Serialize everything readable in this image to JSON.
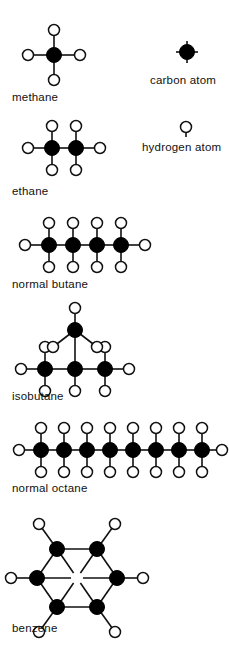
{
  "figure": {
    "background_color": "#ffffff",
    "bond_color": "#111111",
    "carbon_color": "#000000",
    "hydrogen_fill": "#ffffff",
    "hydrogen_stroke": "#111111",
    "carbon_radius": 7.5,
    "hydrogen_radius": 5.5,
    "width": 229,
    "height": 649
  },
  "legend": {
    "carbon": {
      "label": "carbon atom",
      "label_x": 150,
      "label_y": 84,
      "center_x": 187,
      "center_y": 52,
      "stub_length": 11
    },
    "hydrogen": {
      "label": "hydrogen atom",
      "label_x": 142,
      "label_y": 151,
      "center_x": 186,
      "center_y": 127,
      "stub_length": 10
    }
  },
  "molecules": [
    {
      "name": "methane",
      "formula_carbons": 1,
      "label_x": 12,
      "label_y": 101,
      "carbons": [
        {
          "x": 54,
          "y": 55
        }
      ],
      "hydrogens": [
        {
          "x": 54,
          "y": 30,
          "bond_to": 0
        },
        {
          "x": 54,
          "y": 80,
          "bond_to": 0
        },
        {
          "x": 28,
          "y": 55,
          "bond_to": 0
        },
        {
          "x": 80,
          "y": 55,
          "bond_to": 0
        }
      ],
      "cc_bonds": []
    },
    {
      "name": "ethane",
      "formula_carbons": 2,
      "label_x": 12,
      "label_y": 195,
      "carbons": [
        {
          "x": 52,
          "y": 148
        },
        {
          "x": 76,
          "y": 148
        }
      ],
      "hydrogens": [
        {
          "x": 52,
          "y": 126,
          "bond_to": 0
        },
        {
          "x": 52,
          "y": 170,
          "bond_to": 0
        },
        {
          "x": 28,
          "y": 148,
          "bond_to": 0
        },
        {
          "x": 76,
          "y": 126,
          "bond_to": 1
        },
        {
          "x": 76,
          "y": 170,
          "bond_to": 1
        },
        {
          "x": 100,
          "y": 148,
          "bond_to": 1
        }
      ],
      "cc_bonds": [
        [
          0,
          1
        ]
      ]
    },
    {
      "name": "normal butane",
      "formula_carbons": 4,
      "label_x": 12,
      "label_y": 288,
      "carbons": [
        {
          "x": 49,
          "y": 245
        },
        {
          "x": 73,
          "y": 245
        },
        {
          "x": 97,
          "y": 245
        },
        {
          "x": 121,
          "y": 245
        }
      ],
      "hydrogens": [
        {
          "x": 49,
          "y": 223,
          "bond_to": 0
        },
        {
          "x": 49,
          "y": 267,
          "bond_to": 0
        },
        {
          "x": 25,
          "y": 245,
          "bond_to": 0
        },
        {
          "x": 73,
          "y": 223,
          "bond_to": 1
        },
        {
          "x": 73,
          "y": 267,
          "bond_to": 1
        },
        {
          "x": 97,
          "y": 223,
          "bond_to": 2
        },
        {
          "x": 97,
          "y": 267,
          "bond_to": 2
        },
        {
          "x": 121,
          "y": 223,
          "bond_to": 3
        },
        {
          "x": 121,
          "y": 267,
          "bond_to": 3
        },
        {
          "x": 145,
          "y": 245,
          "bond_to": 3
        }
      ],
      "cc_bonds": [
        [
          0,
          1
        ],
        [
          1,
          2
        ],
        [
          2,
          3
        ]
      ]
    },
    {
      "name": "isobutane",
      "formula_carbons": 4,
      "label_x": 12,
      "label_y": 400,
      "carbons": [
        {
          "x": 45,
          "y": 369
        },
        {
          "x": 75,
          "y": 369
        },
        {
          "x": 105,
          "y": 369
        },
        {
          "x": 75,
          "y": 330
        }
      ],
      "hydrogens": [
        {
          "x": 45,
          "y": 347,
          "bond_to": 0
        },
        {
          "x": 45,
          "y": 391,
          "bond_to": 0
        },
        {
          "x": 21,
          "y": 369,
          "bond_to": 0
        },
        {
          "x": 75,
          "y": 391,
          "bond_to": 1
        },
        {
          "x": 105,
          "y": 347,
          "bond_to": 2
        },
        {
          "x": 105,
          "y": 391,
          "bond_to": 2
        },
        {
          "x": 129,
          "y": 369,
          "bond_to": 2
        },
        {
          "x": 75,
          "y": 308,
          "bond_to": 3
        },
        {
          "x": 53,
          "y": 347,
          "bond_to": 3
        },
        {
          "x": 97,
          "y": 347,
          "bond_to": 3
        }
      ],
      "cc_bonds": [
        [
          0,
          1
        ],
        [
          1,
          2
        ],
        [
          1,
          3
        ]
      ]
    },
    {
      "name": "normal octane",
      "formula_carbons": 8,
      "label_x": 12,
      "label_y": 492,
      "carbons": [
        {
          "x": 41,
          "y": 450
        },
        {
          "x": 64,
          "y": 450
        },
        {
          "x": 87,
          "y": 450
        },
        {
          "x": 110,
          "y": 450
        },
        {
          "x": 133,
          "y": 450
        },
        {
          "x": 156,
          "y": 450
        },
        {
          "x": 179,
          "y": 450
        },
        {
          "x": 202,
          "y": 450
        }
      ],
      "hydrogens": [
        {
          "x": 41,
          "y": 428,
          "bond_to": 0
        },
        {
          "x": 41,
          "y": 472,
          "bond_to": 0
        },
        {
          "x": 19,
          "y": 450,
          "bond_to": 0
        },
        {
          "x": 64,
          "y": 428,
          "bond_to": 1
        },
        {
          "x": 64,
          "y": 472,
          "bond_to": 1
        },
        {
          "x": 87,
          "y": 428,
          "bond_to": 2
        },
        {
          "x": 87,
          "y": 472,
          "bond_to": 2
        },
        {
          "x": 110,
          "y": 428,
          "bond_to": 3
        },
        {
          "x": 110,
          "y": 472,
          "bond_to": 3
        },
        {
          "x": 133,
          "y": 428,
          "bond_to": 4
        },
        {
          "x": 133,
          "y": 472,
          "bond_to": 4
        },
        {
          "x": 156,
          "y": 428,
          "bond_to": 5
        },
        {
          "x": 156,
          "y": 472,
          "bond_to": 5
        },
        {
          "x": 179,
          "y": 428,
          "bond_to": 6
        },
        {
          "x": 179,
          "y": 472,
          "bond_to": 6
        },
        {
          "x": 202,
          "y": 428,
          "bond_to": 7
        },
        {
          "x": 202,
          "y": 472,
          "bond_to": 7
        },
        {
          "x": 222,
          "y": 450,
          "bond_to": 7
        }
      ],
      "cc_bonds": [
        [
          0,
          1
        ],
        [
          1,
          2
        ],
        [
          2,
          3
        ],
        [
          3,
          4
        ],
        [
          4,
          5
        ],
        [
          5,
          6
        ],
        [
          6,
          7
        ]
      ]
    },
    {
      "name": "benzene",
      "formula_carbons": 6,
      "label_x": 12,
      "label_y": 632,
      "ring_center": {
        "x": 77,
        "y": 578
      },
      "carbons": [
        {
          "x": 57,
          "y": 549
        },
        {
          "x": 97,
          "y": 549
        },
        {
          "x": 117,
          "y": 578
        },
        {
          "x": 97,
          "y": 607
        },
        {
          "x": 57,
          "y": 607
        },
        {
          "x": 37,
          "y": 578
        }
      ],
      "hydrogens": [
        {
          "x": 39,
          "y": 524,
          "bond_to": 0
        },
        {
          "x": 115,
          "y": 524,
          "bond_to": 1
        },
        {
          "x": 143,
          "y": 578,
          "bond_to": 2
        },
        {
          "x": 115,
          "y": 632,
          "bond_to": 3
        },
        {
          "x": 39,
          "y": 632,
          "bond_to": 4
        },
        {
          "x": 11,
          "y": 578,
          "bond_to": 5
        }
      ],
      "cc_bonds": [
        [
          0,
          1
        ],
        [
          1,
          2
        ],
        [
          2,
          3
        ],
        [
          3,
          4
        ],
        [
          4,
          5
        ],
        [
          5,
          0
        ]
      ],
      "center_spokes": true
    }
  ]
}
